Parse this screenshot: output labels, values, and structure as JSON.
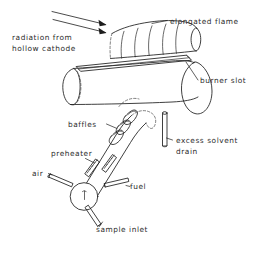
{
  "figure": {
    "type": "line-drawing-schematic",
    "background_color": "#ffffff",
    "ink_color": "#1d1d1d",
    "text_color": "#2b2b2b"
  },
  "labels": {
    "radiation_source": "radiation from\nhollow cathode",
    "radiation_source_line1": "radiation from",
    "radiation_source_line2": "hollow cathode",
    "elongated_flame": "elongated flame",
    "burner_slot": "burner slot",
    "baffles": "baffles",
    "excess_solvent_drain_line1": "excess solvent",
    "excess_solvent_drain_line2": "drain",
    "preheater": "preheater",
    "air": "air",
    "fuel": "fuel",
    "sample_inlet": "sample inlet"
  },
  "components": [
    {
      "name": "elongated-flame",
      "shape": "tilted cylinder with internal flame striations, above burner head"
    },
    {
      "name": "burner-head",
      "shape": "horizontal cylinder with elliptical end caps"
    },
    {
      "name": "burner-slot",
      "shape": "narrow parallelogram strip along top of burner head"
    },
    {
      "name": "spray-chamber",
      "shape": "diagonal tube from lower-left nebulizer to burner head"
    },
    {
      "name": "baffles",
      "shape": "wavy vane shapes inside upper spray chamber"
    },
    {
      "name": "preheater-coils",
      "shape": "two coil elements inside spray chamber"
    },
    {
      "name": "nebulizer",
      "shape": "circle at lower-left end of spray chamber"
    },
    {
      "name": "air-inlet-tube",
      "shape": "short tube entering nebulizer from left"
    },
    {
      "name": "fuel-inlet-tube",
      "shape": "short tube entering spray chamber from right"
    },
    {
      "name": "sample-inlet-tube",
      "shape": "short tube descending from nebulizer"
    },
    {
      "name": "drain-tube",
      "shape": "vertical tube below burner head right side"
    },
    {
      "name": "radiation-beam-arrows",
      "shape": "two parallel arrows aimed down-right at flame"
    }
  ],
  "arrows": {
    "count": 2,
    "direction": "down-right",
    "meaning": "light beam from hollow cathode lamp traversing the flame"
  }
}
